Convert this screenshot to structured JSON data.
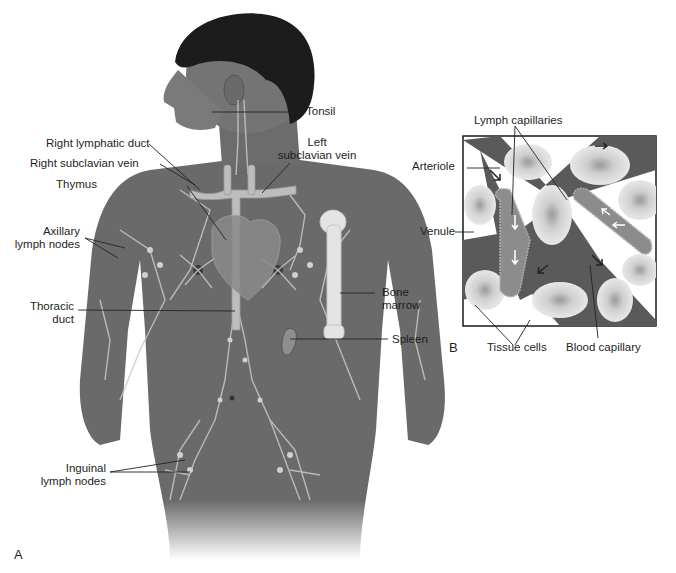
{
  "figure": {
    "panel_a_letter": "A",
    "panel_b_letter": "B",
    "panel_a": {
      "description": "Anterior view of male torso showing the lymphatic system",
      "labels": {
        "tonsil": "Tonsil",
        "right_lymphatic_duct": "Right lymphatic duct",
        "right_subclavian_vein": "Right subclavian vein",
        "left_subclavian_vein_line1": "Left",
        "left_subclavian_vein_line2": "subclavian vein",
        "thymus": "Thymus",
        "axillary_line1": "Axillary",
        "axillary_line2": "lymph nodes",
        "thoracic_line1": "Thoracic",
        "thoracic_line2": "duct",
        "bone_marrow_line1": "Bone",
        "bone_marrow_line2": "marrow",
        "spleen": "Spleen",
        "inguinal_line1": "Inguinal",
        "inguinal_line2": "lymph nodes"
      }
    },
    "panel_b": {
      "description": "Magnified view of lymph capillaries among tissue cells and blood vessels",
      "labels": {
        "lymph_capillaries": "Lymph capillaries",
        "arteriole": "Arteriole",
        "venule": "Venule",
        "tissue_cells": "Tissue cells",
        "blood_capillary": "Blood capillary"
      }
    },
    "colors": {
      "skin": "#6e6e6e",
      "skin_dark": "#4a4a4a",
      "hair": "#1c1c1c",
      "lymph_vessel": "#c8c8c8",
      "leader_line": "#222222",
      "background": "#ffffff"
    }
  }
}
